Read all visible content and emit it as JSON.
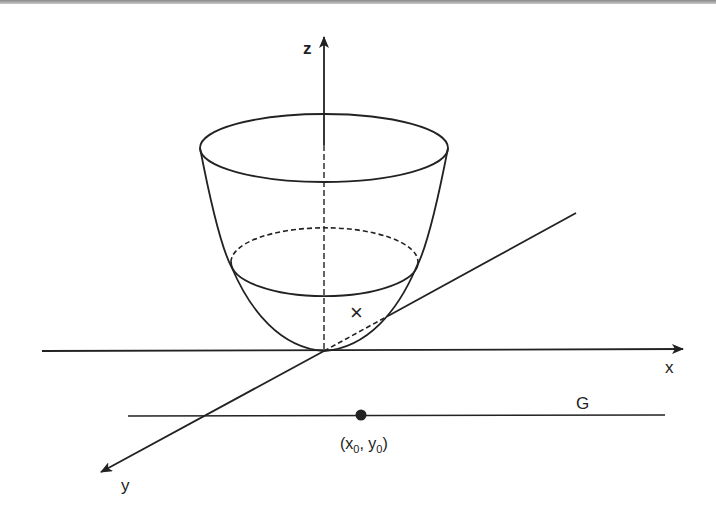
{
  "figure": {
    "colors": {
      "ink": "#222222",
      "background": "#ffffff",
      "top_band": "#9a9a9a"
    }
  },
  "axes": {
    "x_label": "x",
    "y_label": "y",
    "z_label": "z"
  },
  "annotations": {
    "cross_mark": "×",
    "line_label": "G",
    "point_label_x": "(x",
    "point_sub_x": "0",
    "point_label_sep": ", y",
    "point_sub_y": "0",
    "point_label_close": ")"
  }
}
